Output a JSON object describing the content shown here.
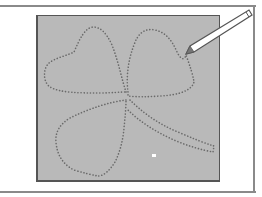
{
  "illustration": {
    "subject": "shamrock-tracing",
    "description": "Dotted outline of a three-leaf clover on a gray panel with a pencil tracing the outline",
    "colors": {
      "background": "#ffffff",
      "frame": "#8a8a8a",
      "panel_fill": "#b9b9b9",
      "panel_border": "#555555",
      "dotted_outline": "#6a6a6a",
      "pencil_body": "#ffffff",
      "pencil_outline": "#555555"
    },
    "elements": [
      "outer-frame",
      "gray-panel",
      "clover-left-leaf",
      "clover-top-right-leaf",
      "clover-bottom-leaf",
      "clover-stem",
      "pencil",
      "white-dot"
    ]
  }
}
